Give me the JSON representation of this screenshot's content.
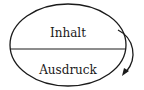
{
  "diagram": {
    "type": "sign-model-ellipse",
    "top_label": "Inhalt",
    "bottom_label": "Ausdruck",
    "arrow": {
      "from": "top",
      "to": "bottom",
      "side": "right",
      "direction": "downward"
    },
    "colors": {
      "stroke": "#1a1a1a",
      "background": "#ffffff"
    }
  }
}
